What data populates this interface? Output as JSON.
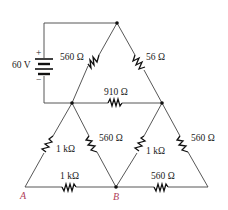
{
  "diagram": {
    "type": "circuit",
    "source": {
      "label": "60 V",
      "plus": "+",
      "minus": "−"
    },
    "resistors": [
      {
        "id": "r-top-left",
        "label": "560 Ω"
      },
      {
        "id": "r-top-right",
        "label": "56 Ω"
      },
      {
        "id": "r-mid-horizontal",
        "label": "910 Ω"
      },
      {
        "id": "r-lower-left-outer",
        "label": "1 kΩ"
      },
      {
        "id": "r-lower-left-inner",
        "label": "560 Ω"
      },
      {
        "id": "r-lower-right-inner",
        "label": "1 kΩ"
      },
      {
        "id": "r-lower-right-outer",
        "label": "560 Ω"
      },
      {
        "id": "r-bottom-left",
        "label": "1 kΩ"
      },
      {
        "id": "r-bottom-right",
        "label": "560 Ω"
      }
    ],
    "terminals": [
      {
        "id": "A",
        "label": "A"
      },
      {
        "id": "B",
        "label": "B"
      }
    ],
    "colors": {
      "wire": "#444444",
      "terminal_label": "#b0405a",
      "text": "#222222"
    }
  }
}
